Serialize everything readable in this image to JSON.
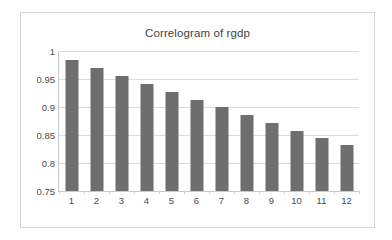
{
  "chart_data": {
    "type": "bar",
    "title": "Correlogram of rgdp",
    "xlabel": "",
    "ylabel": "",
    "categories": [
      "1",
      "2",
      "3",
      "4",
      "5",
      "6",
      "7",
      "8",
      "9",
      "10",
      "11",
      "12"
    ],
    "values": [
      0.984,
      0.97,
      0.956,
      0.941,
      0.927,
      0.913,
      0.9,
      0.886,
      0.871,
      0.857,
      0.845,
      0.832
    ],
    "ylim": [
      0.75,
      1
    ],
    "yticks": [
      0.75,
      0.8,
      0.85,
      0.9,
      0.95,
      1
    ],
    "ytick_labels": [
      "0.75",
      "0.8",
      "0.85",
      "0.9",
      "0.95",
      "1"
    ],
    "grid": true,
    "legend": false,
    "legend_position": "none",
    "series_color": "#6e6e6e",
    "gridline_color": "#dcdcdc",
    "axis_color": "#c9c9c9",
    "plot_background": "#ffffff",
    "frame_border_color": "#d6d6d6"
  }
}
